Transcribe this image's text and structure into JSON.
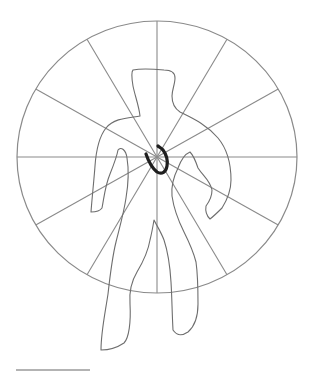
{
  "diagram": {
    "type": "target-figure",
    "canvas": {
      "width": 310,
      "height": 372
    },
    "colors": {
      "background": "#ffffff",
      "circle_stroke": "#8a8a8a",
      "spoke_stroke": "#8a8a8a",
      "figure_stroke": "#6e6e6e",
      "mark_stroke": "#1e1e1e",
      "underline_stroke": "#9a9a9a"
    },
    "circle": {
      "cx": 157,
      "cy": 157,
      "rx": 140,
      "ry": 136,
      "stroke_width": 1.2
    },
    "spokes": {
      "count": 12,
      "angles_deg": [
        0,
        30,
        60,
        90,
        120,
        150,
        180,
        210,
        240,
        270,
        300,
        330
      ],
      "stroke_width": 1.1
    },
    "figure": {
      "description": "human body outline",
      "stroke_width": 1.1
    },
    "mark": {
      "description": "dark horseshoe-shaped mark at the center",
      "stroke_width": 3.2
    },
    "underline": {
      "x1": 16,
      "y1": 370,
      "x2": 90,
      "y2": 370,
      "stroke_width": 1.5
    }
  }
}
